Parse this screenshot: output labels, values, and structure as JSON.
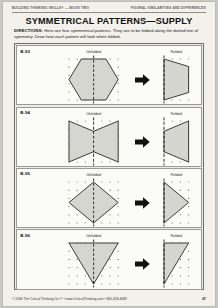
{
  "page": {
    "running_head_left": "Building Thinking Skills® — Book Two",
    "running_head_right": "Figural Similarities and Differences",
    "title": "SYMMETRICAL PATTERNS—SUPPLY",
    "directions_label": "DIRECTIONS:",
    "directions_text": " Here are four symmetrical patterns. They are to be folded along the dotted line of symmetry. Draw how each pattern will look when folded.",
    "footer_copyright": "© 2006 The Critical Thinking Co.™ • www.CriticalThinking.com • 800-458-4849",
    "page_number": "47"
  },
  "labels": {
    "unfolded": "Unfolded",
    "folded": "Folded",
    "arrow_icon": "right-arrow-icon"
  },
  "colors": {
    "shape_fill": "#d3d2cd",
    "shape_stroke": "#3a3a3a",
    "fold_line": "#1c1c1c",
    "dot": "#6b6b6b",
    "panel_bg": "#fbfbf8",
    "page_bg": "#f2f1ec",
    "frame_border": "#6e6e6e",
    "arrow": "#111111"
  },
  "grid": {
    "cols": 7,
    "rows": 6,
    "spacing": 8.2,
    "folded_cols": 4
  },
  "exercises": [
    {
      "id": "B-93",
      "shape_name": "hexagon",
      "unfolded_points": "0,20.5 12.3,0 37.0,0 49.2,20.5 37.0,41 12.3,41",
      "folded_points": "0,0 24.6,7.5 24.6,33.5 0,41",
      "fold_x": 24.6
    },
    {
      "id": "B-94",
      "shape_name": "hourglass-bowtie",
      "unfolded_points": "0,0 24.6,10.3 49.2,0 49.2,41 24.6,30.7 0,41",
      "folded_points": "0,10.3 24.6,0 24.6,41 0,30.7",
      "fold_x": 24.6
    },
    {
      "id": "B-95",
      "shape_name": "diamond-rhombus",
      "unfolded_points": "0,20.5 24.6,0 49.2,20.5 24.6,41",
      "folded_points": "0,0 24.6,20.5 0,41",
      "fold_x": 24.6
    },
    {
      "id": "B-96",
      "shape_name": "inverted-triangle",
      "unfolded_points": "0,0 49.2,0 24.6,41",
      "folded_points": "0,0 24.6,0 0,41",
      "fold_x": 24.6
    }
  ]
}
